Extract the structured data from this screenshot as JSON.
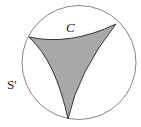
{
  "figure": {
    "labels": {
      "region": "C",
      "circle": "S'"
    },
    "colors": {
      "circle_stroke": "#777777",
      "region_fill": "#a8a8a8",
      "region_stroke": "#333333",
      "background": "#ffffff"
    }
  }
}
